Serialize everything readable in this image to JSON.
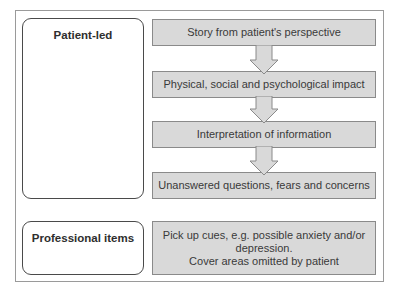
{
  "diagram": {
    "roles": [
      {
        "label": "Patient-led"
      },
      {
        "label": "Professional items"
      }
    ],
    "patient_steps": [
      {
        "label": "Story from patient's perspective"
      },
      {
        "label": "Physical, social and psychological impact"
      },
      {
        "label": "Interpretation of information"
      },
      {
        "label": "Unanswered questions, fears and concerns"
      }
    ],
    "professional_step": {
      "lines": [
        "Pick up cues, e.g. possible anxiety and/or",
        "depression.",
        "Cover areas omitted by patient"
      ]
    },
    "colors": {
      "step_fill": "#d9d9d9",
      "step_border": "#8a8a8a",
      "role_border": "#4a4a4a",
      "frame_border": "#9a9a9a"
    }
  }
}
